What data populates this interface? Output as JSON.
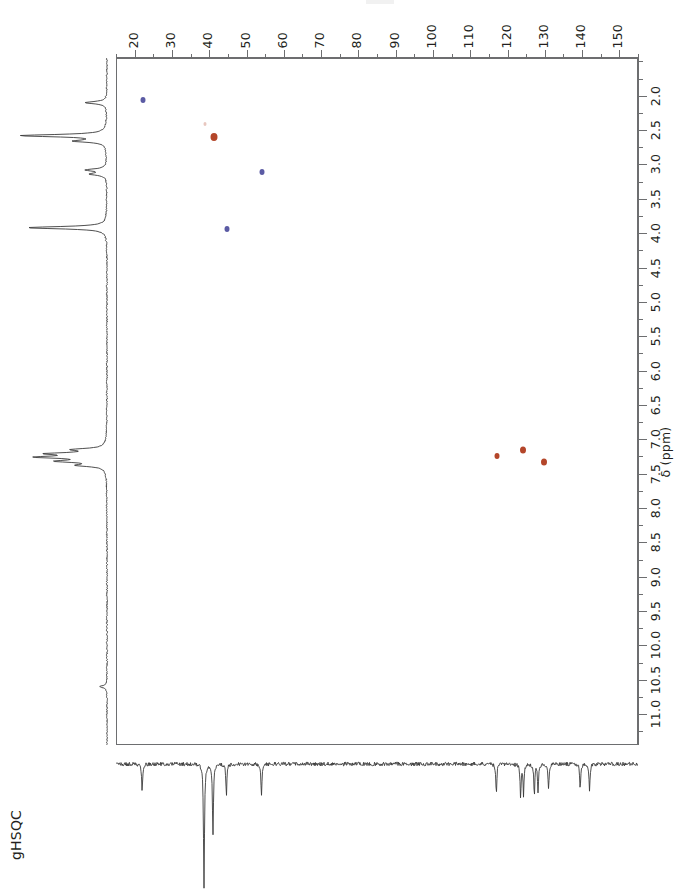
{
  "experiment": {
    "label": "gHSQC",
    "type": "2D heteronuclear single quantum coherence NMR spectrum"
  },
  "chart_data": {
    "type": "scatter",
    "title": "gHSQC",
    "xlabel": "",
    "ylabel": "δ (ppm)",
    "grid": false,
    "legend": "none",
    "x_axis": {
      "position": "top",
      "nucleus": "13C",
      "unit": "ppm",
      "range": [
        15,
        155
      ],
      "direction": "increasing-right",
      "major_ticks": [
        20,
        30,
        40,
        50,
        60,
        70,
        80,
        90,
        100,
        110,
        120,
        130,
        140,
        150
      ],
      "minor_tick_step": 5,
      "tick_labels": [
        "20",
        "30",
        "40",
        "50",
        "60",
        "70",
        "80",
        "90",
        "100",
        "110",
        "120",
        "130",
        "140",
        "150"
      ]
    },
    "y_axis": {
      "position": "right",
      "nucleus": "1H",
      "unit": "ppm",
      "label": "δ (ppm)",
      "range": [
        1.45,
        11.45
      ],
      "direction": "increasing-down",
      "major_ticks": [
        2.0,
        2.5,
        3.0,
        3.5,
        4.0,
        4.5,
        5.0,
        5.5,
        6.0,
        6.5,
        7.0,
        7.5,
        8.0,
        8.5,
        9.0,
        9.5,
        10.0,
        10.5,
        11.0
      ],
      "minor_tick_step": 0.25,
      "tick_labels": [
        "2.0",
        "2.5",
        "3.0",
        "3.5",
        "4.0",
        "4.5",
        "5.0",
        "5.5",
        "6.0",
        "6.5",
        "7.0",
        "7.5",
        "8.0",
        "8.5",
        "9.0",
        "9.5",
        "10.0",
        "10.5",
        "11.0"
      ]
    },
    "colors": {
      "positive_phase": "#5b5ba4",
      "negative_phase": "#b4462a",
      "axis": "#6d6e70",
      "trace": "#3a3a3a",
      "text": "#231f20"
    },
    "cross_peaks": [
      {
        "carbon_ppm": 22.0,
        "proton_ppm": 2.05,
        "color": "#5b5ba4",
        "phase": "positive",
        "size": 5
      },
      {
        "carbon_ppm": 41.0,
        "proton_ppm": 2.59,
        "color": "#b4462a",
        "phase": "negative",
        "size": 7
      },
      {
        "carbon_ppm": 38.5,
        "proton_ppm": 2.4,
        "color": "#b4462a",
        "phase": "negative",
        "size": 3
      },
      {
        "carbon_ppm": 54.0,
        "proton_ppm": 3.1,
        "color": "#5b5ba4",
        "phase": "positive",
        "size": 5
      },
      {
        "carbon_ppm": 44.5,
        "proton_ppm": 3.92,
        "color": "#5b5ba4",
        "phase": "positive",
        "size": 5
      },
      {
        "carbon_ppm": 117.0,
        "proton_ppm": 7.23,
        "color": "#b4462a",
        "phase": "negative",
        "size": 5
      },
      {
        "carbon_ppm": 124.0,
        "proton_ppm": 7.14,
        "color": "#b4462a",
        "phase": "negative",
        "size": 6
      },
      {
        "carbon_ppm": 129.5,
        "proton_ppm": 7.31,
        "color": "#b4462a",
        "phase": "negative",
        "size": 6
      }
    ],
    "proton_projection": {
      "orientation": "vertical-left",
      "direction": "peaks-point-left",
      "peaks": [
        {
          "ppm": 2.1,
          "intensity": 0.22
        },
        {
          "ppm": 2.58,
          "intensity": 0.86
        },
        {
          "ppm": 2.66,
          "intensity": 0.3
        },
        {
          "ppm": 3.08,
          "intensity": 0.2
        },
        {
          "ppm": 3.14,
          "intensity": 0.16
        },
        {
          "ppm": 3.92,
          "intensity": 0.8
        },
        {
          "ppm": 7.15,
          "intensity": 0.3
        },
        {
          "ppm": 7.21,
          "intensity": 0.52
        },
        {
          "ppm": 7.26,
          "intensity": 0.62
        },
        {
          "ppm": 7.32,
          "intensity": 0.44
        },
        {
          "ppm": 7.38,
          "intensity": 0.26
        },
        {
          "ppm": 10.6,
          "intensity": 0.07
        }
      ]
    },
    "carbon_projection": {
      "orientation": "horizontal-bottom",
      "direction": "peaks-point-down",
      "peaks": [
        {
          "ppm": 22.0,
          "intensity": 0.22
        },
        {
          "ppm": 38.6,
          "intensity": 0.98
        },
        {
          "ppm": 41.0,
          "intensity": 0.56
        },
        {
          "ppm": 44.6,
          "intensity": 0.25
        },
        {
          "ppm": 54.0,
          "intensity": 0.25
        },
        {
          "ppm": 117.0,
          "intensity": 0.24
        },
        {
          "ppm": 123.5,
          "intensity": 0.26
        },
        {
          "ppm": 124.3,
          "intensity": 0.24
        },
        {
          "ppm": 127.2,
          "intensity": 0.25
        },
        {
          "ppm": 128.2,
          "intensity": 0.22
        },
        {
          "ppm": 131.0,
          "intensity": 0.2
        },
        {
          "ppm": 139.5,
          "intensity": 0.2
        },
        {
          "ppm": 142.0,
          "intensity": 0.21
        }
      ]
    }
  }
}
